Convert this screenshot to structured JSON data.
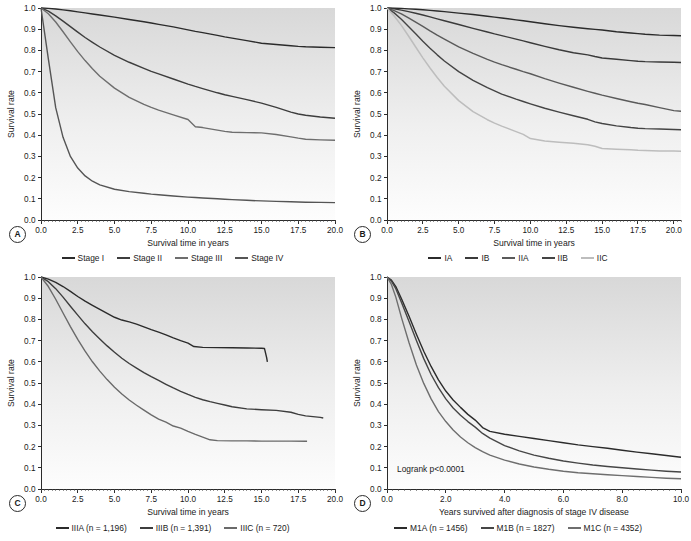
{
  "figure": {
    "panels": [
      {
        "tag": "A",
        "xlabel": "Survival time in years",
        "ylabel": "Survival rate",
        "xticks": [
          "0.0",
          "2.5",
          "5.0",
          "7.5",
          "10.0",
          "12.5",
          "15.0",
          "17.5",
          "20.0"
        ],
        "yticks": [
          "0.0",
          "0.1",
          "0.2",
          "0.3",
          "0.4",
          "0.5",
          "0.6",
          "0.7",
          "0.8",
          "0.9",
          "1.0"
        ],
        "legend": [
          {
            "label": "Stage I",
            "color": "#2b2b2b"
          },
          {
            "label": "Stage II",
            "color": "#3d3d3d"
          },
          {
            "label": "Stage III",
            "color": "#6e6e6e"
          },
          {
            "label": "Stage IV",
            "color": "#555555"
          }
        ]
      },
      {
        "tag": "B",
        "xlabel": "Survival time in years",
        "ylabel": "Survival rate",
        "xticks": [
          "0.0",
          "2.5",
          "5.0",
          "7.5",
          "10.0",
          "12.5",
          "15.0",
          "17.5",
          "20.0"
        ],
        "yticks": [
          "0.0",
          "0.1",
          "0.2",
          "0.3",
          "0.4",
          "0.5",
          "0.6",
          "0.7",
          "0.8",
          "0.9",
          "1.0"
        ],
        "legend": [
          {
            "label": "IA",
            "color": "#2b2b2b"
          },
          {
            "label": "IB",
            "color": "#3a3a3a"
          },
          {
            "label": "IIA",
            "color": "#5a5a5a"
          },
          {
            "label": "IIB",
            "color": "#444444"
          },
          {
            "label": "IIC",
            "color": "#bdbdbd"
          }
        ]
      },
      {
        "tag": "C",
        "xlabel": "Survival time in years",
        "ylabel": "Survival rate",
        "xticks": [
          "0.0",
          "2.5",
          "5.0",
          "7.5",
          "10.0",
          "12.5",
          "15.0",
          "17.5",
          "20.0"
        ],
        "yticks": [
          "0.0",
          "0.1",
          "0.2",
          "0.3",
          "0.4",
          "0.5",
          "0.6",
          "0.7",
          "0.8",
          "0.9",
          "1.0"
        ],
        "legend": [
          {
            "label": "IIIA (n = 1,196)",
            "color": "#2b2b2b"
          },
          {
            "label": "IIIB (n = 1,391)",
            "color": "#3d3d3d"
          },
          {
            "label": "IIIC (n = 720)",
            "color": "#6a6a6a"
          }
        ]
      },
      {
        "tag": "D",
        "xlabel": "Years survived after diagnosis of stage IV disease",
        "ylabel": "Survival rate",
        "annotation": "Logrank p<0.0001",
        "xticks": [
          "0.0",
          "2.0",
          "4.0",
          "6.0",
          "8.0",
          "10.0"
        ],
        "yticks": [
          "0.0",
          "0.1",
          "0.2",
          "0.3",
          "0.4",
          "0.5",
          "0.6",
          "0.7",
          "0.8",
          "0.9",
          "1.0"
        ],
        "legend": [
          {
            "label": "M1A (n = 1456)",
            "color": "#2b2b2b"
          },
          {
            "label": "M1B (n = 1827)",
            "color": "#464646"
          },
          {
            "label": "M1C (n = 4352)",
            "color": "#6e6e6e"
          }
        ]
      }
    ]
  },
  "chart_data": [
    {
      "panel": "A",
      "type": "line",
      "title": "",
      "xlabel": "Survival time in years",
      "ylabel": "Survival rate",
      "xlim": [
        0,
        20
      ],
      "ylim": [
        0,
        1
      ],
      "grid": false,
      "legend_position": "bottom",
      "x": [
        0,
        0.5,
        1,
        1.5,
        2,
        2.5,
        3,
        3.5,
        4,
        5,
        6,
        7,
        7.5,
        8,
        9,
        10,
        10.5,
        11,
        12,
        12.5,
        13,
        14,
        15,
        16,
        17,
        17.5,
        18,
        19,
        20
      ],
      "series": [
        {
          "name": "Stage I",
          "color": "#2b2b2b",
          "values": [
            1.0,
            0.998,
            0.995,
            0.991,
            0.987,
            0.982,
            0.977,
            0.972,
            0.967,
            0.957,
            0.946,
            0.935,
            0.929,
            0.923,
            0.911,
            0.897,
            0.89,
            0.884,
            0.871,
            0.864,
            0.858,
            0.846,
            0.834,
            0.828,
            0.822,
            0.819,
            0.817,
            0.815,
            0.813
          ]
        },
        {
          "name": "Stage II",
          "color": "#3d3d3d",
          "values": [
            1.0,
            0.985,
            0.963,
            0.938,
            0.912,
            0.886,
            0.861,
            0.838,
            0.816,
            0.777,
            0.744,
            0.715,
            0.701,
            0.689,
            0.665,
            0.641,
            0.63,
            0.62,
            0.6,
            0.591,
            0.583,
            0.568,
            0.551,
            0.531,
            0.509,
            0.5,
            0.494,
            0.486,
            0.48
          ]
        },
        {
          "name": "Stage III",
          "color": "#6e6e6e",
          "values": [
            1.0,
            0.973,
            0.934,
            0.888,
            0.84,
            0.794,
            0.752,
            0.713,
            0.678,
            0.622,
            0.578,
            0.545,
            0.531,
            0.518,
            0.496,
            0.474,
            0.44,
            0.436,
            0.424,
            0.418,
            0.414,
            0.412,
            0.411,
            0.403,
            0.392,
            0.386,
            0.381,
            0.378,
            0.376
          ]
        },
        {
          "name": "Stage IV",
          "color": "#555555",
          "values": [
            1.0,
            0.76,
            0.53,
            0.39,
            0.3,
            0.245,
            0.208,
            0.183,
            0.166,
            0.145,
            0.134,
            0.126,
            0.122,
            0.119,
            0.113,
            0.108,
            0.106,
            0.104,
            0.1,
            0.098,
            0.096,
            0.093,
            0.09,
            0.088,
            0.086,
            0.085,
            0.084,
            0.083,
            0.082
          ]
        }
      ]
    },
    {
      "panel": "B",
      "type": "line",
      "title": "",
      "xlabel": "Survival time in years",
      "ylabel": "Survival rate",
      "xlim": [
        0,
        20.5
      ],
      "ylim": [
        0,
        1
      ],
      "grid": false,
      "legend_position": "bottom",
      "x": [
        0,
        0.5,
        1,
        1.5,
        2,
        2.5,
        3,
        3.5,
        4,
        5,
        6,
        7,
        7.5,
        8,
        9,
        9.5,
        10,
        11,
        12,
        13,
        14,
        14.5,
        15,
        16,
        17,
        17.5,
        18,
        19,
        20,
        20.5
      ],
      "series": [
        {
          "name": "IA",
          "color": "#2b2b2b",
          "values": [
            1.0,
            0.999,
            0.998,
            0.996,
            0.994,
            0.992,
            0.989,
            0.986,
            0.983,
            0.976,
            0.969,
            0.961,
            0.957,
            0.953,
            0.944,
            0.94,
            0.935,
            0.926,
            0.917,
            0.909,
            0.902,
            0.899,
            0.896,
            0.888,
            0.882,
            0.879,
            0.876,
            0.872,
            0.87,
            0.869
          ]
        },
        {
          "name": "IB",
          "color": "#3a3a3a",
          "values": [
            1.0,
            0.996,
            0.99,
            0.983,
            0.975,
            0.967,
            0.958,
            0.949,
            0.94,
            0.922,
            0.904,
            0.887,
            0.878,
            0.87,
            0.853,
            0.845,
            0.836,
            0.819,
            0.803,
            0.789,
            0.779,
            0.771,
            0.764,
            0.758,
            0.752,
            0.749,
            0.747,
            0.745,
            0.744,
            0.743
          ]
        },
        {
          "name": "IIA",
          "color": "#5a5a5a",
          "values": [
            1.0,
            0.988,
            0.972,
            0.953,
            0.933,
            0.913,
            0.892,
            0.872,
            0.853,
            0.817,
            0.786,
            0.758,
            0.745,
            0.733,
            0.711,
            0.7,
            0.69,
            0.667,
            0.646,
            0.626,
            0.607,
            0.598,
            0.589,
            0.573,
            0.558,
            0.551,
            0.545,
            0.53,
            0.516,
            0.513
          ]
        },
        {
          "name": "IIB",
          "color": "#444444",
          "values": [
            1.0,
            0.977,
            0.947,
            0.913,
            0.878,
            0.843,
            0.81,
            0.779,
            0.75,
            0.7,
            0.659,
            0.624,
            0.609,
            0.594,
            0.57,
            0.559,
            0.548,
            0.527,
            0.509,
            0.492,
            0.475,
            0.463,
            0.455,
            0.444,
            0.436,
            0.433,
            0.431,
            0.429,
            0.427,
            0.426
          ]
        },
        {
          "name": "IIC",
          "color": "#bdbdbd",
          "values": [
            1.0,
            0.962,
            0.918,
            0.868,
            0.816,
            0.765,
            0.717,
            0.672,
            0.631,
            0.563,
            0.511,
            0.473,
            0.457,
            0.443,
            0.417,
            0.404,
            0.384,
            0.373,
            0.367,
            0.362,
            0.355,
            0.348,
            0.337,
            0.334,
            0.331,
            0.329,
            0.328,
            0.326,
            0.325,
            0.324
          ]
        }
      ]
    },
    {
      "panel": "C",
      "type": "line",
      "title": "",
      "xlabel": "Survival time in years",
      "ylabel": "Survival rate",
      "xlim": [
        0,
        20
      ],
      "ylim": [
        0,
        1
      ],
      "grid": false,
      "legend_position": "bottom",
      "series": [
        {
          "name": "IIIA (n = 1,196)",
          "color": "#2b2b2b",
          "n": 1196,
          "x": [
            0,
            0.5,
            1,
            1.5,
            2,
            2.5,
            3,
            3.5,
            4,
            4.5,
            5,
            5.5,
            6,
            6.5,
            7,
            7.5,
            8,
            8.5,
            9,
            9.5,
            10,
            10.4,
            11,
            12,
            13,
            14,
            15,
            15.2,
            15.35,
            15.4
          ],
          "values": [
            1.0,
            0.99,
            0.975,
            0.955,
            0.932,
            0.908,
            0.886,
            0.866,
            0.847,
            0.828,
            0.81,
            0.797,
            0.788,
            0.778,
            0.765,
            0.752,
            0.74,
            0.727,
            0.713,
            0.7,
            0.688,
            0.672,
            0.668,
            0.667,
            0.666,
            0.665,
            0.664,
            0.663,
            0.62,
            0.6
          ]
        },
        {
          "name": "IIIB (n = 1,391)",
          "color": "#3d3d3d",
          "n": 1391,
          "x": [
            0,
            0.5,
            1,
            1.5,
            2,
            2.5,
            3,
            3.5,
            4,
            4.5,
            5,
            5.5,
            6,
            6.5,
            7,
            7.5,
            8,
            8.5,
            9,
            9.5,
            10,
            10.5,
            11,
            11.5,
            12,
            12.5,
            13,
            14,
            15,
            16,
            17,
            17.5,
            18,
            19,
            19.2
          ],
          "values": [
            1.0,
            0.978,
            0.945,
            0.905,
            0.862,
            0.82,
            0.779,
            0.742,
            0.708,
            0.675,
            0.645,
            0.617,
            0.592,
            0.57,
            0.549,
            0.53,
            0.512,
            0.494,
            0.477,
            0.461,
            0.446,
            0.432,
            0.421,
            0.412,
            0.404,
            0.396,
            0.388,
            0.378,
            0.374,
            0.371,
            0.362,
            0.352,
            0.345,
            0.338,
            0.335
          ]
        },
        {
          "name": "IIIC (n = 720)",
          "color": "#6a6a6a",
          "n": 720,
          "x": [
            0,
            0.5,
            1,
            1.5,
            2,
            2.5,
            3,
            3.5,
            4,
            4.5,
            5,
            5.5,
            6,
            6.5,
            7,
            7.5,
            8,
            8.5,
            9,
            9.5,
            10,
            10.5,
            11,
            11.5,
            12,
            13,
            14,
            15,
            16,
            17,
            18,
            18.1
          ],
          "values": [
            1.0,
            0.955,
            0.895,
            0.83,
            0.766,
            0.706,
            0.65,
            0.6,
            0.556,
            0.516,
            0.48,
            0.448,
            0.42,
            0.395,
            0.372,
            0.35,
            0.33,
            0.315,
            0.297,
            0.287,
            0.272,
            0.258,
            0.245,
            0.232,
            0.228,
            0.227,
            0.227,
            0.226,
            0.226,
            0.226,
            0.225,
            0.225
          ]
        }
      ]
    },
    {
      "panel": "D",
      "type": "line",
      "title": "",
      "xlabel": "Years survived after diagnosis of stage IV disease",
      "ylabel": "Survival rate",
      "annotation": "Logrank p<0.0001",
      "xlim": [
        0,
        10
      ],
      "ylim": [
        0,
        1
      ],
      "grid": false,
      "legend_position": "bottom",
      "x": [
        0,
        0.15,
        0.3,
        0.5,
        0.75,
        1,
        1.25,
        1.5,
        1.75,
        2,
        2.25,
        2.5,
        2.75,
        3,
        3.25,
        3.5,
        4,
        4.5,
        5,
        5.5,
        6,
        6.5,
        7,
        7.5,
        8,
        8.5,
        9,
        9.5,
        10
      ],
      "series": [
        {
          "name": "M1A (n = 1456)",
          "color": "#2b2b2b",
          "n": 1456,
          "values": [
            1.0,
            0.985,
            0.955,
            0.895,
            0.815,
            0.73,
            0.65,
            0.578,
            0.515,
            0.462,
            0.42,
            0.385,
            0.352,
            0.325,
            0.29,
            0.272,
            0.258,
            0.248,
            0.238,
            0.228,
            0.218,
            0.208,
            0.2,
            0.192,
            0.183,
            0.174,
            0.166,
            0.158,
            0.15
          ]
        },
        {
          "name": "M1B (n = 1827)",
          "color": "#464646",
          "n": 1827,
          "values": [
            1.0,
            0.98,
            0.945,
            0.878,
            0.79,
            0.7,
            0.615,
            0.54,
            0.478,
            0.425,
            0.382,
            0.348,
            0.318,
            0.292,
            0.262,
            0.24,
            0.205,
            0.18,
            0.16,
            0.145,
            0.132,
            0.122,
            0.113,
            0.106,
            0.1,
            0.094,
            0.089,
            0.084,
            0.08
          ]
        },
        {
          "name": "M1C (n = 4352)",
          "color": "#6e6e6e",
          "n": 4352,
          "values": [
            1.0,
            0.965,
            0.905,
            0.805,
            0.69,
            0.585,
            0.498,
            0.425,
            0.365,
            0.318,
            0.278,
            0.245,
            0.218,
            0.195,
            0.176,
            0.16,
            0.136,
            0.118,
            0.104,
            0.093,
            0.084,
            0.077,
            0.072,
            0.067,
            0.063,
            0.059,
            0.055,
            0.051,
            0.048
          ]
        }
      ]
    }
  ]
}
